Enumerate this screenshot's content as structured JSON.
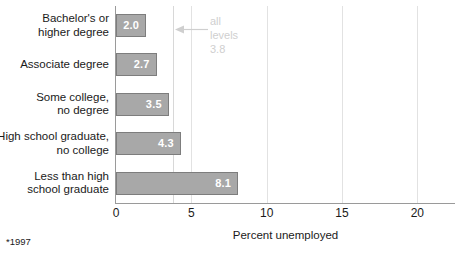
{
  "chart_data": {
    "type": "bar",
    "orientation": "horizontal",
    "title": "",
    "xlabel": "Percent unemployed",
    "ylabel": "",
    "xlim": [
      0,
      22.5
    ],
    "xticks": [
      "0",
      "5",
      "10",
      "15",
      "20"
    ],
    "xtick_values": [
      0,
      5,
      10,
      15,
      20
    ],
    "grid": true,
    "legend": "none",
    "categories": [
      "Bachelor's or\nhigher degree",
      "Associate degree",
      "Some college,\nno degree",
      "High school graduate,\nno college",
      "Less than high\nschool graduate"
    ],
    "values": [
      2.0,
      2.7,
      3.5,
      4.3,
      8.1
    ],
    "value_labels": [
      "2.0",
      "2.7",
      "3.5",
      "4.3",
      "8.1"
    ],
    "reference_line": {
      "value": 3.8,
      "label_line1": "all",
      "label_line2": "levels",
      "label_line3": "3.8"
    },
    "footnote": "*1997",
    "colors": {
      "bar_fill": "#a8a8a8",
      "bar_stroke": "#7d7d7d",
      "value_text": "#ffffff",
      "grid": "#e2e2e2",
      "axis": "#9a9a9a",
      "annotation": "#cfcfcf",
      "text": "#1a1a1a"
    }
  },
  "rows": [
    {
      "label_line1": "Bachelor's or",
      "label_line2": "higher degree",
      "value": "2.0"
    },
    {
      "label_line1": "Associate degree",
      "label_line2": "",
      "value": "2.7"
    },
    {
      "label_line1": "Some college,",
      "label_line2": "no degree",
      "value": "3.5"
    },
    {
      "label_line1": "High school graduate,",
      "label_line2": "no college",
      "value": "4.3"
    },
    {
      "label_line1": "Less than high",
      "label_line2": "school graduate",
      "value": "8.1"
    }
  ],
  "axis": {
    "ticks": [
      "0",
      "5",
      "10",
      "15",
      "20"
    ],
    "title": "Percent unemployed"
  },
  "annotation": {
    "line1": "all",
    "line2": "levels",
    "line3": "3.8"
  },
  "footnote": {
    "text": "*1997"
  }
}
